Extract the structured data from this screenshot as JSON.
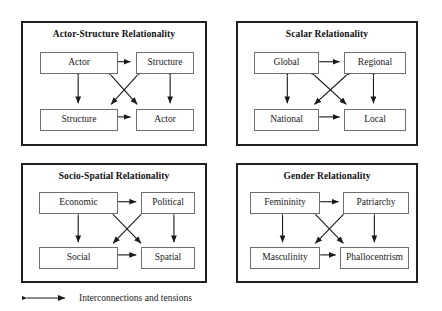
{
  "figure": {
    "kind": "relationality-quadrant-diagram",
    "stroke_color": "#1a1a1a",
    "panel_border_color": "#1f1f1f",
    "box_border_color": "#6e6e6e",
    "background": "#ffffff"
  },
  "panels": [
    {
      "id": "actor-structure",
      "title": "Actor-Structure Relationality",
      "nodes": {
        "top_left": "Actor",
        "top_right": "Structure",
        "bottom_left": "Structure",
        "bottom_right": "Actor"
      }
    },
    {
      "id": "scalar",
      "title": "Scalar Relationality",
      "nodes": {
        "top_left": "Global",
        "top_right": "Regional",
        "bottom_left": "National",
        "bottom_right": "Local"
      }
    },
    {
      "id": "socio-spatial",
      "title": "Socio-Spatial Relationality",
      "nodes": {
        "top_left": "Economic",
        "top_right": "Political",
        "bottom_left": "Social",
        "bottom_right": "Spatial"
      }
    },
    {
      "id": "gender",
      "title": "Gender Relationality",
      "nodes": {
        "top_left": "Femininity",
        "top_right": "Patriarchy",
        "bottom_left": "Masculinity",
        "bottom_right": "Phallocentrism"
      }
    }
  ],
  "legend": {
    "label": "Interconnections and tensions",
    "symbol": "double-headed-arrow"
  }
}
